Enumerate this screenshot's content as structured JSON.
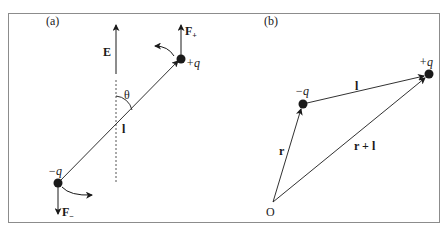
{
  "figure": {
    "panels": [
      {
        "id": "a",
        "label": "(a)",
        "field_label": "E",
        "angle_label": "θ",
        "dipole_label": "l",
        "positive_charge_label": "+q",
        "negative_charge_label": "−q",
        "force_positive_label": "F",
        "force_positive_sub": "+",
        "force_negative_label": "F",
        "force_negative_sub": "−"
      },
      {
        "id": "b",
        "label": "(b)",
        "negative_charge_label": "−q",
        "positive_charge_label": "+q",
        "dipole_label": "l",
        "position_label": "r",
        "sum_label": "r + l",
        "origin_label": "O"
      }
    ],
    "colors": {
      "ink": "#1a1a1a",
      "frame": "#8c8c8c",
      "dashed": "#555555"
    }
  }
}
